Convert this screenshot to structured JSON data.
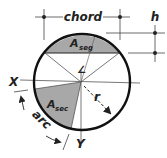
{
  "diagram": {
    "labels": {
      "chord": "chord",
      "h": "h",
      "a_seg_main": "A",
      "a_seg_sub": "seg",
      "a_sec_main": "A",
      "a_sec_sub": "sec",
      "x_axis": "X",
      "y_axis": "Y",
      "radius": "r",
      "arc": "arc",
      "angle": "∠"
    },
    "colors": {
      "outline": "#111111",
      "shade": "#a8a8a8",
      "thin_line": "#444444"
    }
  }
}
